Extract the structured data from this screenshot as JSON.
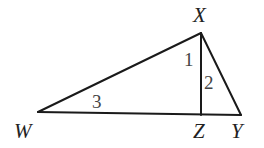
{
  "diagram": {
    "type": "triangle-with-altitude",
    "vertices": {
      "W": {
        "label": "W",
        "x": 38,
        "y": 112
      },
      "X": {
        "label": "X",
        "x": 201,
        "y": 33
      },
      "Z": {
        "label": "Z",
        "x": 201,
        "y": 115
      },
      "Y": {
        "label": "Y",
        "x": 241,
        "y": 115
      }
    },
    "segments": [
      {
        "from": "W",
        "to": "X"
      },
      {
        "from": "X",
        "to": "Y"
      },
      {
        "from": "W",
        "to": "Y"
      },
      {
        "from": "X",
        "to": "Z"
      }
    ],
    "vertex_labels": {
      "X": "X",
      "W": "W",
      "Z": "Z",
      "Y": "Y"
    },
    "angle_labels": {
      "a1": "1",
      "a2": "2",
      "a3": "3"
    }
  }
}
